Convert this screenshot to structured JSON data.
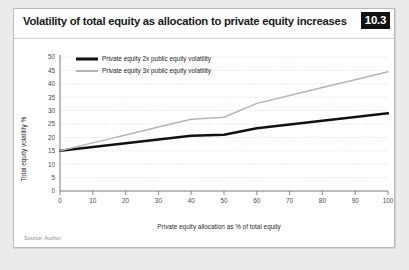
{
  "card": {
    "title": "Volatility of total equity as allocation to private equity increases",
    "figure_number": "10.3",
    "source": "Source: Author"
  },
  "colors": {
    "series_2x": "#111111",
    "series_3x": "#b5b5b5",
    "grid": "#cfcfcf",
    "axis": "#6b6b6b",
    "badge_bg": "#111111",
    "badge_text": "#ffffff",
    "card_bg": "#ffffff",
    "page_bg": "#ebebeb"
  },
  "chart_data": {
    "type": "line",
    "title": "Volatility of total equity as allocation to private equity increases",
    "xlabel": "Private equity allocation as % of total equity",
    "ylabel": "Total equity volatility %",
    "xlim": [
      0,
      100
    ],
    "ylim": [
      0,
      50
    ],
    "xticks": [
      0,
      10,
      20,
      30,
      40,
      50,
      60,
      70,
      80,
      90,
      100
    ],
    "yticks": [
      0,
      5,
      10,
      15,
      20,
      25,
      30,
      35,
      40,
      45,
      50
    ],
    "grid": "horizontal-dotted",
    "legend_position": "top-left",
    "x": [
      0,
      10,
      20,
      30,
      40,
      50,
      60,
      70,
      80,
      90,
      100
    ],
    "series": [
      {
        "name": "Private equity 2x public equity volatility",
        "color": "#111111",
        "width": 2.4,
        "values": [
          15.0,
          16.4,
          17.8,
          19.2,
          20.6,
          21.0,
          23.4,
          24.8,
          26.2,
          27.6,
          29.0
        ]
      },
      {
        "name": "Private equity 3x public equity volatility",
        "color": "#b5b5b5",
        "width": 1.5,
        "values": [
          15.0,
          17.95,
          20.9,
          23.85,
          26.8,
          27.5,
          32.7,
          35.65,
          38.6,
          41.55,
          44.5
        ]
      }
    ]
  }
}
